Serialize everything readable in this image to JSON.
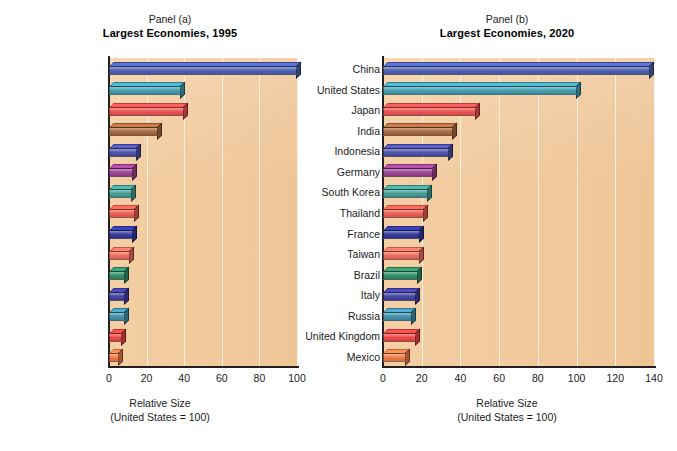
{
  "figure": {
    "background": "#ffffff",
    "plot_background": "#f3c99a",
    "gridline_color": "#fdf0e2",
    "axis_color": "#231f20"
  },
  "panels": [
    {
      "kicker": "Panel (a)",
      "title": "Largest Economies, 1995",
      "xlabel_line1": "Relative Size",
      "xlabel_line2": "(United States = 100)"
    },
    {
      "kicker": "Panel (b)",
      "title": "Largest Economies, 2020",
      "xlabel_line1": "Relative Size",
      "xlabel_line2": "(United States = 100)"
    }
  ],
  "chart_data": [
    {
      "type": "bar",
      "orientation": "horizontal",
      "title": "Largest Economies, 1995",
      "subtitle": "Panel (a)",
      "xlabel": "Relative Size (United States = 100)",
      "ylabel": "",
      "xlim": [
        0,
        100
      ],
      "xticks": [
        0,
        20,
        40,
        60,
        80,
        100
      ],
      "grid": true,
      "legend": "none",
      "categories": [
        "United States",
        "Japan",
        "China",
        "Germany",
        "France",
        "India",
        "Italy",
        "United Kingdom",
        "Russia",
        "Brazil",
        "Mexico",
        "Indonesia",
        "Canada",
        "Spain",
        "South Korea"
      ],
      "values": [
        100,
        38.5,
        40,
        26,
        15,
        13,
        12,
        14,
        13,
        11,
        8.5,
        8.5,
        8.5,
        7,
        5.5
      ],
      "colors": [
        "#4a5fb0",
        "#3e9cb0",
        "#ee4d4d",
        "#a9663c",
        "#4a4fa8",
        "#9b3f91",
        "#3f9b92",
        "#ee5a4f",
        "#30369c",
        "#ee6a5a",
        "#2e8b66",
        "#3e3fa0",
        "#3e8fab",
        "#ee4343",
        "#f07a45"
      ]
    },
    {
      "type": "bar",
      "orientation": "horizontal",
      "title": "Largest Economies, 2020",
      "subtitle": "Panel (b)",
      "xlabel": "Relative Size (United States = 100)",
      "ylabel": "",
      "xlim": [
        0,
        140
      ],
      "xticks": [
        0,
        20,
        40,
        60,
        80,
        100,
        120,
        140
      ],
      "grid": true,
      "legend": "none",
      "categories": [
        "China",
        "United States",
        "Japan",
        "India",
        "Indonesia",
        "Germany",
        "South Korea",
        "Thailand",
        "France",
        "Taiwan",
        "Brazil",
        "Italy",
        "Russia",
        "United Kingdom",
        "Mexico"
      ],
      "values": [
        138,
        100,
        48,
        36,
        34,
        26,
        23,
        21,
        19,
        19,
        18,
        17,
        15,
        17,
        12
      ],
      "colors": [
        "#4a5fb0",
        "#3e9cb0",
        "#ee4d4d",
        "#a9663c",
        "#4a4fa8",
        "#9b3f91",
        "#3f9b92",
        "#ee5a4f",
        "#30369c",
        "#ee6a5a",
        "#2e8b66",
        "#3e3fa0",
        "#3e8fab",
        "#ee4343",
        "#f07a45"
      ]
    }
  ]
}
